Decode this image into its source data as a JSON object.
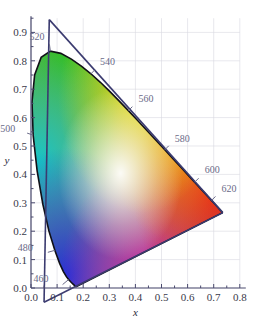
{
  "chart_data": {
    "type": "scatter",
    "xlabel": "x",
    "ylabel": "y",
    "xlim": [
      0.0,
      0.8
    ],
    "ylim": [
      0.0,
      0.95
    ],
    "grid": true,
    "legend": "none",
    "x_ticks": [
      "0.0",
      "0.1",
      "0.2",
      "0.3",
      "0.4",
      "0.5",
      "0.6",
      "0.7",
      "0.8"
    ],
    "x_tick_values": [
      0.0,
      0.1,
      0.2,
      0.3,
      0.4,
      0.5,
      0.6,
      0.7,
      0.8
    ],
    "y_ticks": [
      "0.0",
      "0.1",
      "0.2",
      "0.3",
      "0.4",
      "0.5",
      "0.6",
      "0.7",
      "0.8",
      "0.9"
    ],
    "y_tick_values": [
      0.0,
      0.1,
      0.2,
      0.3,
      0.4,
      0.5,
      0.6,
      0.7,
      0.8,
      0.9
    ],
    "wavelength_labels": [
      {
        "label": "460",
        "x": 0.144,
        "y": 0.0297
      },
      {
        "label": "480",
        "x": 0.0913,
        "y": 0.1327
      },
      {
        "label": "500",
        "x": 0.0082,
        "y": 0.5384
      },
      {
        "label": "520",
        "x": 0.0743,
        "y": 0.8338
      },
      {
        "label": "540",
        "x": 0.2296,
        "y": 0.7543
      },
      {
        "label": "560",
        "x": 0.3731,
        "y": 0.6245
      },
      {
        "label": "580",
        "x": 0.5125,
        "y": 0.4866
      },
      {
        "label": "600",
        "x": 0.627,
        "y": 0.3725
      },
      {
        "label": "620",
        "x": 0.6915,
        "y": 0.3083
      }
    ],
    "spectral_locus": [
      [
        0.1741,
        0.005
      ],
      [
        0.174,
        0.005
      ],
      [
        0.1738,
        0.0049
      ],
      [
        0.1736,
        0.0049
      ],
      [
        0.1733,
        0.0048
      ],
      [
        0.173,
        0.0048
      ],
      [
        0.1726,
        0.0048
      ],
      [
        0.1721,
        0.0048
      ],
      [
        0.1714,
        0.0051
      ],
      [
        0.1703,
        0.0058
      ],
      [
        0.1689,
        0.0069
      ],
      [
        0.1669,
        0.0086
      ],
      [
        0.1644,
        0.0109
      ],
      [
        0.1611,
        0.0138
      ],
      [
        0.1566,
        0.0177
      ],
      [
        0.151,
        0.0227
      ],
      [
        0.144,
        0.0297
      ],
      [
        0.1355,
        0.0399
      ],
      [
        0.1241,
        0.0578
      ],
      [
        0.1096,
        0.0868
      ],
      [
        0.0913,
        0.1327
      ],
      [
        0.0687,
        0.2007
      ],
      [
        0.0454,
        0.295
      ],
      [
        0.0235,
        0.4127
      ],
      [
        0.0082,
        0.5384
      ],
      [
        0.0039,
        0.6548
      ],
      [
        0.0139,
        0.7502
      ],
      [
        0.0389,
        0.812
      ],
      [
        0.0743,
        0.8338
      ],
      [
        0.1142,
        0.8262
      ],
      [
        0.1547,
        0.8059
      ],
      [
        0.1929,
        0.7816
      ],
      [
        0.2296,
        0.7543
      ],
      [
        0.2658,
        0.7243
      ],
      [
        0.3016,
        0.6923
      ],
      [
        0.3373,
        0.6589
      ],
      [
        0.3731,
        0.6245
      ],
      [
        0.4087,
        0.5896
      ],
      [
        0.4441,
        0.5547
      ],
      [
        0.4788,
        0.5202
      ],
      [
        0.5125,
        0.4866
      ],
      [
        0.5448,
        0.4544
      ],
      [
        0.5752,
        0.4242
      ],
      [
        0.6029,
        0.3965
      ],
      [
        0.627,
        0.3725
      ],
      [
        0.6482,
        0.3514
      ],
      [
        0.6658,
        0.334
      ],
      [
        0.6801,
        0.3197
      ],
      [
        0.6915,
        0.3083
      ],
      [
        0.7006,
        0.2993
      ],
      [
        0.7079,
        0.292
      ],
      [
        0.714,
        0.2859
      ],
      [
        0.719,
        0.2809
      ],
      [
        0.723,
        0.277
      ],
      [
        0.726,
        0.274
      ],
      [
        0.7283,
        0.2717
      ],
      [
        0.73,
        0.27
      ],
      [
        0.7311,
        0.2689
      ],
      [
        0.732,
        0.268
      ],
      [
        0.7327,
        0.2673
      ],
      [
        0.7334,
        0.2666
      ],
      [
        0.734,
        0.266
      ],
      [
        0.7344,
        0.2656
      ],
      [
        0.7346,
        0.2654
      ],
      [
        0.7347,
        0.2653
      ]
    ],
    "triangle_vertices": [
      {
        "name": "green-apex",
        "x": 0.07,
        "y": 0.945
      },
      {
        "name": "red-apex",
        "x": 0.7347,
        "y": 0.2653
      },
      {
        "name": "blue-apex",
        "x": 0.05,
        "y": -0.05
      }
    ]
  },
  "axes": {
    "x_title": "x",
    "y_title": "y"
  },
  "colors": {
    "axis": "#4a4a6e",
    "locus": "#111118",
    "triangle": "#3b3b70",
    "grid": "#d8d8e0",
    "tick_text": "#3a3a4a",
    "wavelength_text": "#6a6a88",
    "background": "#ffffff"
  }
}
